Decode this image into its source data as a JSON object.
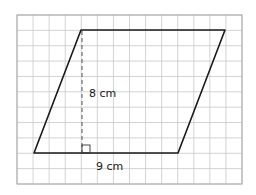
{
  "figure": {
    "shape": "parallelogram",
    "height_label": "8 cm",
    "base_label": "9 cm",
    "colors": {
      "grid": "#c8c8c8",
      "outline": "#1a1a1a",
      "border": "#a8a8a8",
      "background": "#ffffff"
    },
    "grid": {
      "columns": 14,
      "rows": 11
    }
  }
}
